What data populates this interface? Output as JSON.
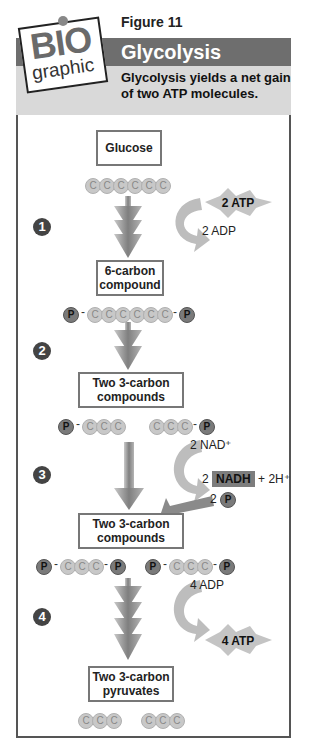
{
  "header": {
    "logo_top": "BIO",
    "logo_bottom": "graphic",
    "figure_label": "Figure 11",
    "title": "Glycolysis",
    "subtitle": "Glycolysis yields a net gain of two ATP molecules."
  },
  "steps": [
    "1",
    "2",
    "3",
    "4"
  ],
  "boxes": {
    "glucose": "Glucose",
    "six_carbon": "6-carbon compound",
    "two_three_carbon_a": "Two 3-carbon compounds",
    "two_three_carbon_b": "Two 3-carbon compounds",
    "pyruvates": "Two 3-carbon pyruvates"
  },
  "atoms": {
    "carbon": "C",
    "phosphate": "P",
    "dash": "-"
  },
  "step1": {
    "atp_in": "2 ATP",
    "adp_out": "2 ADP"
  },
  "step3": {
    "nad_in": "2 NAD⁺",
    "nadh_count": "2",
    "nadh": "NADH",
    "h_out": "+ 2H⁺",
    "p_count": "2"
  },
  "step4": {
    "adp_in": "4 ADP",
    "atp_out": "4 ATP"
  },
  "colors": {
    "title_bar": "#6e6e6e",
    "subtitle_band": "#d9d9d9",
    "arrow": "#8a8a8a",
    "curve_arrow": "#bdbdbd",
    "carbon": "#c8c8c8",
    "phosphate": "#7a7a7a"
  }
}
